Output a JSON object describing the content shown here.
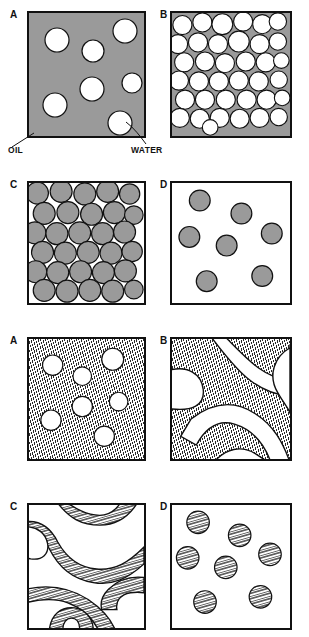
{
  "figure": {
    "colors": {
      "oil_phase_gray": "#9a9a9a",
      "water_phase_white": "#ffffff",
      "outline": "#111111",
      "hatch_line": "#2a2a2a"
    },
    "annotations": [
      {
        "id": "oil",
        "label": "OIL"
      },
      {
        "id": "water",
        "label": "WATER"
      }
    ],
    "upper_set": {
      "panels": [
        {
          "letter": "A",
          "name": "oil-continuous-dilute-droplets",
          "description": "Water droplets dispersed in continuous gray oil phase",
          "continuous_phase": "oil",
          "dispersed_phase": "water",
          "fill": "gray",
          "droplet_fill": "white",
          "droplet_count": 7,
          "droplets": [
            {
              "cx": 28,
              "cy": 27,
              "r": 12
            },
            {
              "cx": 64,
              "cy": 38,
              "r": 11
            },
            {
              "cx": 96,
              "cy": 18,
              "r": 12
            },
            {
              "cx": 63,
              "cy": 76,
              "r": 12
            },
            {
              "cx": 103,
              "cy": 70,
              "r": 10
            },
            {
              "cx": 26,
              "cy": 92,
              "r": 12
            },
            {
              "cx": 91,
              "cy": 110,
              "r": 12
            }
          ]
        },
        {
          "letter": "B",
          "name": "oil-continuous-concentrated-packed-droplets",
          "description": "Densely packed white water droplets with thin gray oil films",
          "continuous_phase": "oil",
          "dispersed_phase": "water",
          "fill": "gray",
          "droplet_fill": "white",
          "droplet_count": 37,
          "droplets": [
            {
              "cx": 12,
              "cy": 13,
              "r": 11
            },
            {
              "cx": 35,
              "cy": 10,
              "r": 11
            },
            {
              "cx": 58,
              "cy": 12,
              "r": 12
            },
            {
              "cx": 82,
              "cy": 9,
              "r": 11
            },
            {
              "cx": 104,
              "cy": 12,
              "r": 11
            },
            {
              "cx": 122,
              "cy": 9,
              "r": 10
            },
            {
              "cx": 7,
              "cy": 35,
              "r": 11
            },
            {
              "cx": 30,
              "cy": 33,
              "r": 11
            },
            {
              "cx": 53,
              "cy": 35,
              "r": 11
            },
            {
              "cx": 77,
              "cy": 32,
              "r": 12
            },
            {
              "cx": 101,
              "cy": 35,
              "r": 11
            },
            {
              "cx": 122,
              "cy": 32,
              "r": 10
            },
            {
              "cx": 14,
              "cy": 56,
              "r": 11
            },
            {
              "cx": 38,
              "cy": 55,
              "r": 11
            },
            {
              "cx": 61,
              "cy": 57,
              "r": 11
            },
            {
              "cx": 85,
              "cy": 55,
              "r": 11
            },
            {
              "cx": 108,
              "cy": 56,
              "r": 11
            },
            {
              "cx": 126,
              "cy": 54,
              "r": 9
            },
            {
              "cx": 8,
              "cy": 77,
              "r": 11
            },
            {
              "cx": 31,
              "cy": 78,
              "r": 11
            },
            {
              "cx": 54,
              "cy": 78,
              "r": 11
            },
            {
              "cx": 77,
              "cy": 77,
              "r": 11
            },
            {
              "cx": 100,
              "cy": 78,
              "r": 11
            },
            {
              "cx": 123,
              "cy": 76,
              "r": 10
            },
            {
              "cx": 15,
              "cy": 99,
              "r": 11
            },
            {
              "cx": 38,
              "cy": 99,
              "r": 11
            },
            {
              "cx": 62,
              "cy": 99,
              "r": 11
            },
            {
              "cx": 86,
              "cy": 99,
              "r": 11
            },
            {
              "cx": 109,
              "cy": 99,
              "r": 11
            },
            {
              "cx": 127,
              "cy": 97,
              "r": 9
            },
            {
              "cx": 9,
              "cy": 120,
              "r": 11
            },
            {
              "cx": 32,
              "cy": 121,
              "r": 11
            },
            {
              "cx": 55,
              "cy": 120,
              "r": 11
            },
            {
              "cx": 78,
              "cy": 121,
              "r": 11
            },
            {
              "cx": 101,
              "cy": 120,
              "r": 11
            },
            {
              "cx": 123,
              "cy": 119,
              "r": 10
            },
            {
              "cx": 44,
              "cy": 131,
              "r": 9
            }
          ]
        },
        {
          "letter": "C",
          "name": "water-continuous-concentrated-packed-droplets",
          "description": "Densely packed gray oil droplets in continuous white water phase",
          "continuous_phase": "water",
          "dispersed_phase": "oil",
          "fill": "white",
          "droplet_fill": "gray",
          "droplet_count": 30,
          "droplets": [
            {
              "cx": 10,
              "cy": 10,
              "r": 13
            },
            {
              "cx": 38,
              "cy": 8,
              "r": 13
            },
            {
              "cx": 66,
              "cy": 11,
              "r": 13
            },
            {
              "cx": 93,
              "cy": 8,
              "r": 13
            },
            {
              "cx": 119,
              "cy": 11,
              "r": 12
            },
            {
              "cx": 18,
              "cy": 34,
              "r": 13
            },
            {
              "cx": 46,
              "cy": 33,
              "r": 13
            },
            {
              "cx": 74,
              "cy": 35,
              "r": 13
            },
            {
              "cx": 101,
              "cy": 33,
              "r": 13
            },
            {
              "cx": 124,
              "cy": 36,
              "r": 11
            },
            {
              "cx": 7,
              "cy": 57,
              "r": 13
            },
            {
              "cx": 33,
              "cy": 58,
              "r": 13
            },
            {
              "cx": 60,
              "cy": 57,
              "r": 13
            },
            {
              "cx": 87,
              "cy": 58,
              "r": 13
            },
            {
              "cx": 113,
              "cy": 56,
              "r": 13
            },
            {
              "cx": 16,
              "cy": 80,
              "r": 13
            },
            {
              "cx": 43,
              "cy": 81,
              "r": 13
            },
            {
              "cx": 70,
              "cy": 80,
              "r": 13
            },
            {
              "cx": 97,
              "cy": 81,
              "r": 13
            },
            {
              "cx": 122,
              "cy": 79,
              "r": 12
            },
            {
              "cx": 8,
              "cy": 103,
              "r": 13
            },
            {
              "cx": 34,
              "cy": 104,
              "r": 13
            },
            {
              "cx": 61,
              "cy": 103,
              "r": 13
            },
            {
              "cx": 88,
              "cy": 104,
              "r": 13
            },
            {
              "cx": 114,
              "cy": 102,
              "r": 13
            },
            {
              "cx": 18,
              "cy": 125,
              "r": 13
            },
            {
              "cx": 45,
              "cy": 126,
              "r": 13
            },
            {
              "cx": 72,
              "cy": 125,
              "r": 13
            },
            {
              "cx": 99,
              "cy": 126,
              "r": 13
            },
            {
              "cx": 124,
              "cy": 124,
              "r": 11
            }
          ]
        },
        {
          "letter": "D",
          "name": "water-continuous-dilute-droplets",
          "description": "Gray oil droplets dispersed in continuous white water phase",
          "continuous_phase": "water",
          "dispersed_phase": "oil",
          "fill": "white",
          "droplet_fill": "gray",
          "droplet_count": 7,
          "droplets": [
            {
              "cx": 32,
              "cy": 20,
              "r": 12
            },
            {
              "cx": 80,
              "cy": 35,
              "r": 12
            },
            {
              "cx": 20,
              "cy": 62,
              "r": 12
            },
            {
              "cx": 63,
              "cy": 72,
              "r": 12
            },
            {
              "cx": 115,
              "cy": 58,
              "r": 12
            },
            {
              "cx": 40,
              "cy": 113,
              "r": 12
            },
            {
              "cx": 104,
              "cy": 107,
              "r": 12
            }
          ]
        }
      ]
    },
    "lower_set": {
      "panels": [
        {
          "letter": "A",
          "name": "hatched-continuous-dilute-droplets",
          "description": "White droplets dispersed in continuous hatched phase",
          "fill": "hatch",
          "droplet_fill": "white",
          "structure": "droplets",
          "droplet_count": 7,
          "droplets": [
            {
              "cx": 28,
              "cy": 29,
              "r": 12
            },
            {
              "cx": 63,
              "cy": 42,
              "r": 11
            },
            {
              "cx": 99,
              "cy": 22,
              "r": 13
            },
            {
              "cx": 63,
              "cy": 78,
              "r": 12
            },
            {
              "cx": 106,
              "cy": 72,
              "r": 11
            },
            {
              "cx": 26,
              "cy": 94,
              "r": 12
            },
            {
              "cx": 89,
              "cy": 113,
              "r": 12
            }
          ]
        },
        {
          "letter": "B",
          "name": "bicontinuous-hatched-majority",
          "description": "Bicontinuous structure, hatched phase dominant with white channels",
          "fill": "hatch",
          "structure": "bicontinuous",
          "minority_phase": "white"
        },
        {
          "letter": "C",
          "name": "bicontinuous-white-majority",
          "description": "Bicontinuous structure, white phase dominant with hatched channels",
          "fill": "white",
          "structure": "bicontinuous",
          "minority_phase": "hatch"
        },
        {
          "letter": "D",
          "name": "white-continuous-dilute-hatched-droplets",
          "description": "Hatched droplets dispersed in continuous white phase",
          "fill": "white",
          "droplet_fill": "hatch",
          "structure": "droplets",
          "droplet_count": 7,
          "droplets": [
            {
              "cx": 30,
              "cy": 20,
              "r": 13
            },
            {
              "cx": 78,
              "cy": 35,
              "r": 13
            },
            {
              "cx": 18,
              "cy": 61,
              "r": 13
            },
            {
              "cx": 62,
              "cy": 72,
              "r": 13
            },
            {
              "cx": 113,
              "cy": 57,
              "r": 13
            },
            {
              "cx": 38,
              "cy": 112,
              "r": 13
            },
            {
              "cx": 102,
              "cy": 106,
              "r": 13
            }
          ]
        }
      ]
    }
  }
}
